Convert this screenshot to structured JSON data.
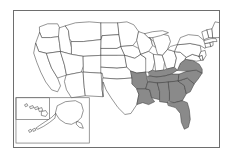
{
  "figure": {
    "type": "choropleth-outline",
    "background_color": "#ffffff",
    "frame_color": "#6e6e6e",
    "state_outline_color": "#3d3d3d",
    "highlight_color": "#8a8a8a",
    "default_state_color": "#ffffff"
  },
  "map_data": {
    "type": "map",
    "region": "United States of America",
    "projection": "albers-usa",
    "legend": [],
    "annotations": [],
    "insets": [
      {
        "name": "alaska-inset",
        "label": "Alaska",
        "highlighted": false
      },
      {
        "name": "hawaii-inset",
        "label": "Hawaii",
        "highlighted": false
      }
    ],
    "highlighted_states": [
      "Arkansas",
      "Louisiana",
      "Mississippi",
      "Alabama",
      "Tennessee",
      "Kentucky",
      "Virginia",
      "North Carolina",
      "South Carolina",
      "Georgia",
      "Florida"
    ],
    "highlighted_count": 11,
    "states": [
      {
        "code": "WA",
        "name": "Washington",
        "highlighted": false
      },
      {
        "code": "OR",
        "name": "Oregon",
        "highlighted": false
      },
      {
        "code": "CA",
        "name": "California",
        "highlighted": false
      },
      {
        "code": "NV",
        "name": "Nevada",
        "highlighted": false
      },
      {
        "code": "ID",
        "name": "Idaho",
        "highlighted": false
      },
      {
        "code": "MT",
        "name": "Montana",
        "highlighted": false
      },
      {
        "code": "WY",
        "name": "Wyoming",
        "highlighted": false
      },
      {
        "code": "UT",
        "name": "Utah",
        "highlighted": false
      },
      {
        "code": "AZ",
        "name": "Arizona",
        "highlighted": false
      },
      {
        "code": "CO",
        "name": "Colorado",
        "highlighted": false
      },
      {
        "code": "NM",
        "name": "New Mexico",
        "highlighted": false
      },
      {
        "code": "ND",
        "name": "North Dakota",
        "highlighted": false
      },
      {
        "code": "SD",
        "name": "South Dakota",
        "highlighted": false
      },
      {
        "code": "NE",
        "name": "Nebraska",
        "highlighted": false
      },
      {
        "code": "KS",
        "name": "Kansas",
        "highlighted": false
      },
      {
        "code": "OK",
        "name": "Oklahoma",
        "highlighted": false
      },
      {
        "code": "TX",
        "name": "Texas",
        "highlighted": false
      },
      {
        "code": "MN",
        "name": "Minnesota",
        "highlighted": false
      },
      {
        "code": "IA",
        "name": "Iowa",
        "highlighted": false
      },
      {
        "code": "MO",
        "name": "Missouri",
        "highlighted": false
      },
      {
        "code": "AR",
        "name": "Arkansas",
        "highlighted": true
      },
      {
        "code": "LA",
        "name": "Louisiana",
        "highlighted": true
      },
      {
        "code": "WI",
        "name": "Wisconsin",
        "highlighted": false
      },
      {
        "code": "IL",
        "name": "Illinois",
        "highlighted": false
      },
      {
        "code": "MI",
        "name": "Michigan",
        "highlighted": false
      },
      {
        "code": "IN",
        "name": "Indiana",
        "highlighted": false
      },
      {
        "code": "OH",
        "name": "Ohio",
        "highlighted": false
      },
      {
        "code": "KY",
        "name": "Kentucky",
        "highlighted": true
      },
      {
        "code": "TN",
        "name": "Tennessee",
        "highlighted": true
      },
      {
        "code": "MS",
        "name": "Mississippi",
        "highlighted": true
      },
      {
        "code": "AL",
        "name": "Alabama",
        "highlighted": true
      },
      {
        "code": "GA",
        "name": "Georgia",
        "highlighted": true
      },
      {
        "code": "FL",
        "name": "Florida",
        "highlighted": true
      },
      {
        "code": "SC",
        "name": "South Carolina",
        "highlighted": true
      },
      {
        "code": "NC",
        "name": "North Carolina",
        "highlighted": true
      },
      {
        "code": "VA",
        "name": "Virginia",
        "highlighted": true
      },
      {
        "code": "WV",
        "name": "West Virginia",
        "highlighted": false
      },
      {
        "code": "MD",
        "name": "Maryland",
        "highlighted": false
      },
      {
        "code": "DE",
        "name": "Delaware",
        "highlighted": false
      },
      {
        "code": "PA",
        "name": "Pennsylvania",
        "highlighted": false
      },
      {
        "code": "NJ",
        "name": "New Jersey",
        "highlighted": false
      },
      {
        "code": "NY",
        "name": "New York",
        "highlighted": false
      },
      {
        "code": "CT",
        "name": "Connecticut",
        "highlighted": false
      },
      {
        "code": "RI",
        "name": "Rhode Island",
        "highlighted": false
      },
      {
        "code": "MA",
        "name": "Massachusetts",
        "highlighted": false
      },
      {
        "code": "VT",
        "name": "Vermont",
        "highlighted": false
      },
      {
        "code": "NH",
        "name": "New Hampshire",
        "highlighted": false
      },
      {
        "code": "ME",
        "name": "Maine",
        "highlighted": false
      },
      {
        "code": "AK",
        "name": "Alaska",
        "highlighted": false
      },
      {
        "code": "HI",
        "name": "Hawaii",
        "highlighted": false
      }
    ]
  }
}
